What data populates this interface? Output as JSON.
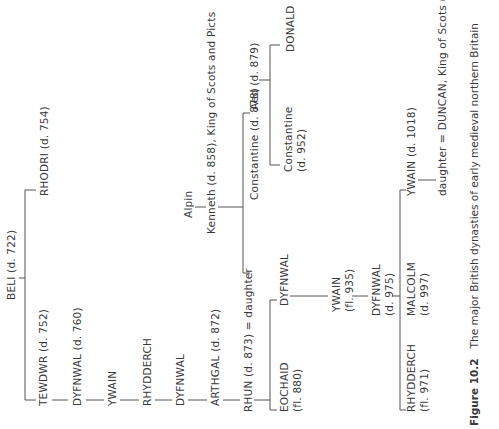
{
  "figure": {
    "number": "Figure 10.2",
    "caption": "The major British dynasties of early medieval northern Britain"
  },
  "people": {
    "beli": "BELI (d. 722)",
    "tewdwr": "TEWDWR (d. 752)",
    "rhodri": "RHODRI (d. 754)",
    "dyfnwal760": "DYFNWAL (d. 760)",
    "ywain1": "YWAIN",
    "rhydderch1": "RHYDDERCH",
    "dyfnwal2": "DYFNWAL",
    "arthgal": "ARTHGAL (d. 872)",
    "rhun": "RHUN (d. 873) = daughter",
    "alpin": "Alpin",
    "kenneth": "Kenneth (d. 858), King of Scots and Picts",
    "constantine878": "Constantine (d. 878)",
    "aed": "Aed (d. 879)",
    "constantine952_name": "Constantine",
    "constantine952_date": "(d. 952)",
    "donald": "DONALD",
    "eochaid_name": "EOCHAID",
    "eochaid_date": "(fl. 880)",
    "dyfnwal3": "DYFNWAL",
    "ywain935_name": "YWAIN",
    "ywain935_date": "(fl. 935)",
    "dyfnwal975_name": "DYFNWAL",
    "dyfnwal975_date": "(d. 975)",
    "rhydderch971_name": "RHYDDERCH",
    "rhydderch971_date": "(fl. 971)",
    "malcolm_name": "MALCOLM",
    "malcolm_date": "(d. 997)",
    "ywain1018": "YWAIN (d. 1018)",
    "duncan": "daughter = DUNCAN, King of Scots (d. 1040)"
  }
}
